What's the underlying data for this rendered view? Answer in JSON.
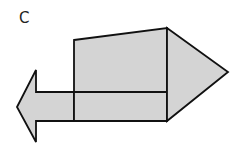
{
  "figure": {
    "label": "C",
    "fill_color": "#d4d4d4",
    "stroke_color": "#111111",
    "shapes": [
      {
        "name": "left-arrow",
        "type": "polygon",
        "points": "17,107 36,70 36,92 74,92 74,121 36,121 36,142"
      },
      {
        "name": "upper-quadrilateral",
        "type": "polygon",
        "points": "74,40 167,28 167,92 74,92"
      },
      {
        "name": "lower-rectangle",
        "type": "polygon",
        "points": "74,92 167,92 167,121 74,121"
      },
      {
        "name": "right-triangle",
        "type": "polygon",
        "points": "167,28 228,72 167,121"
      }
    ]
  }
}
